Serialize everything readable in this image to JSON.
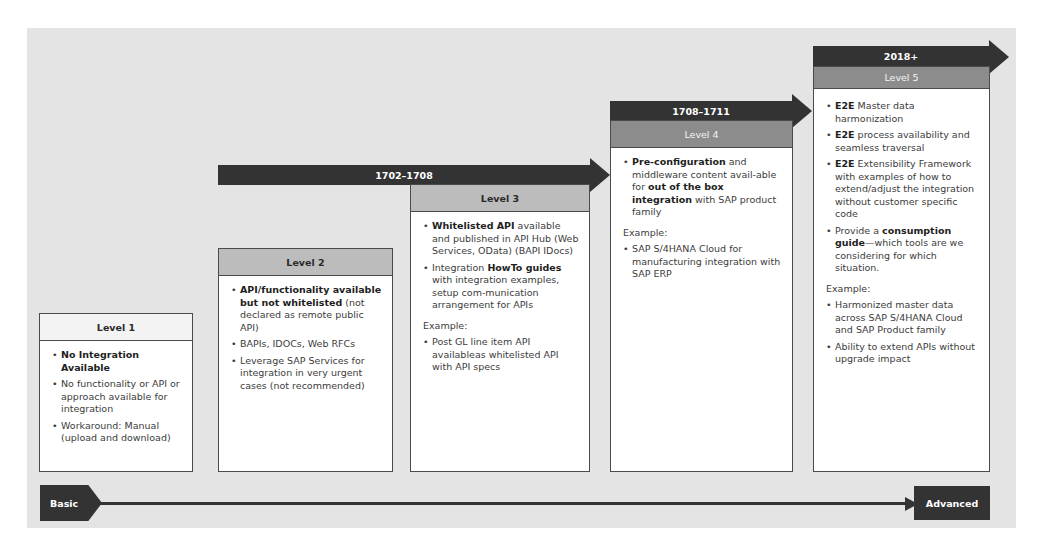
{
  "levels": [
    {
      "title": "Level 1",
      "timeframe": "",
      "bullets": [
        {
          "bold": "No Integration Available",
          "text": ""
        },
        {
          "bold": "",
          "text": "No functionality or API or approach available for integration"
        },
        {
          "bold": "",
          "text": "Workaround: Manual (upload and download)"
        }
      ]
    },
    {
      "title": "Level 2",
      "timeframe": "",
      "bullets": [
        {
          "bold": "API/functionality available but not whitelisted",
          "text": " (not declared as remote public API)"
        },
        {
          "bold": "",
          "text": "BAPIs, IDOCs, Web RFCs"
        },
        {
          "bold": "",
          "text": "Leverage SAP Services for integration in very urgent cases (not recommended)"
        }
      ]
    },
    {
      "title": "Level 3",
      "timeframe": "1702–1708",
      "bullets": [
        {
          "bold": "Whitelisted API",
          "text": " available and published in API Hub (Web Services, OData) (BAPI IDocs)"
        },
        {
          "pre": "Integration ",
          "bold": "HowTo guides",
          "text": " with integration examples, setup com-munication arrangement for APIs"
        }
      ],
      "example_label": "Example:",
      "examples": [
        "Post GL line item API availableas whitelisted API with API specs"
      ]
    },
    {
      "title": "Level 4",
      "timeframe": "1708–1711",
      "bullets": [
        {
          "bold": "Pre-configuration",
          "text": " and middleware content avail-able for ",
          "bold2": "out of the box integration",
          "text2": " with SAP product family"
        }
      ],
      "example_label": "Example:",
      "examples": [
        "SAP S/4HANA Cloud for manufacturing integration with SAP ERP"
      ]
    },
    {
      "title": "Level 5",
      "timeframe": "2018+",
      "bullets": [
        {
          "bold": "E2E",
          "text": " Master data harmonization"
        },
        {
          "bold": "E2E",
          "text": " process availability and seamless traversal"
        },
        {
          "bold": "E2E",
          "text": " Extensibility Framework with examples of how to extend/adjust the integration without customer specific code"
        },
        {
          "pre": "Provide a ",
          "bold": "consumption guide",
          "text": "—which tools are we considering for which situation."
        }
      ],
      "example_label": "Example:",
      "examples": [
        "Harmonized master data across SAP S/4HANA Cloud and SAP Product family",
        "Ability to extend APIs without upgrade impact"
      ]
    }
  ],
  "axis": {
    "start_label": "Basic",
    "end_label": "Advanced"
  },
  "colors": {
    "background": "#e4e4e4",
    "arrow": "#333333",
    "header_mid": "#bcbcbc",
    "header_dark": "#8c8c8c",
    "header_light": "#f3f3f3"
  }
}
